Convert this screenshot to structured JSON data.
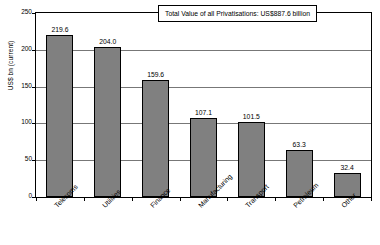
{
  "chart_data": {
    "type": "bar",
    "title": "",
    "subtitle": "",
    "xlabel": "",
    "ylabel": "US$ bn (current)",
    "ylim": [
      0,
      250
    ],
    "yticks": [
      0,
      50,
      100,
      150,
      200,
      250
    ],
    "grid": true,
    "legend": null,
    "categories": [
      "Telecoms",
      "Utilities",
      "Finance",
      "Manufacturing",
      "Transport",
      "Petroleum",
      "Other"
    ],
    "values": [
      219.6,
      204.0,
      159.6,
      107.1,
      101.5,
      63.3,
      32.4
    ],
    "value_labels": [
      "219.6",
      "204.0",
      "159.6",
      "107.1",
      "101.5",
      "63.3",
      "32.4"
    ],
    "bar_color": "#808080",
    "bar_border_color": "#000000",
    "annotations": [
      {
        "name": "total-value-note",
        "text": "Total Value of all Privatisations: US$887.6 billion"
      }
    ]
  }
}
